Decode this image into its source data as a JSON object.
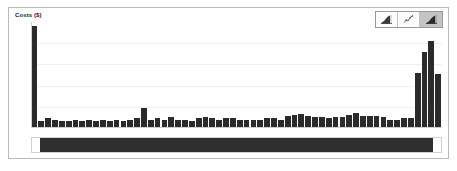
{
  "panel": {
    "axis_title": "Costs ($)",
    "border_color": "#b9b9b9",
    "background": "#ffffff"
  },
  "toolbar": {
    "buttons": [
      {
        "name": "area-chart-icon",
        "label": "Area chart",
        "active": false
      },
      {
        "name": "line-chart-icon",
        "label": "Line chart",
        "active": false
      },
      {
        "name": "bar-chart-icon",
        "label": "Bar chart",
        "active": true
      }
    ],
    "active_index": 2
  },
  "range_slider": {
    "name": "horizontal-range-slider",
    "thumb_start_pct": 2,
    "thumb_width_pct": 96,
    "thumb_color": "#2f2f2f"
  },
  "chart_data": {
    "type": "bar",
    "title": "Costs ($)",
    "xlabel": "",
    "ylabel": "Costs ($)",
    "bar_color": "#2b2b2b",
    "grid": true,
    "gridlines_y": [
      20,
      40,
      60,
      80,
      100
    ],
    "legend": "none",
    "ylim": [
      0,
      100
    ],
    "categories": [
      "1",
      "2",
      "3",
      "4",
      "5",
      "6",
      "7",
      "8",
      "9",
      "10",
      "11",
      "12",
      "13",
      "14",
      "15",
      "16",
      "17",
      "18",
      "19",
      "20",
      "21",
      "22",
      "23",
      "24",
      "25",
      "26",
      "27",
      "28",
      "29",
      "30",
      "31",
      "32",
      "33",
      "34",
      "35",
      "36",
      "37",
      "38",
      "39",
      "40",
      "41",
      "42",
      "43",
      "44",
      "45",
      "46",
      "47",
      "48",
      "49",
      "50",
      "51",
      "52",
      "53",
      "54",
      "55",
      "56",
      "57",
      "58",
      "59",
      "60"
    ],
    "values": [
      96,
      7,
      9,
      8,
      7,
      7,
      8,
      7,
      8,
      7,
      8,
      7,
      8,
      7,
      8,
      9,
      19,
      8,
      9,
      8,
      10,
      8,
      8,
      7,
      9,
      10,
      9,
      8,
      9,
      9,
      8,
      8,
      8,
      8,
      9,
      9,
      8,
      11,
      12,
      13,
      11,
      10,
      10,
      9,
      10,
      10,
      12,
      14,
      11,
      11,
      11,
      10,
      8,
      8,
      9,
      9,
      52,
      72,
      82,
      51
    ]
  }
}
